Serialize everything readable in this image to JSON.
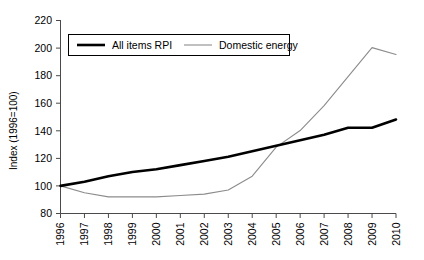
{
  "chart_data": {
    "type": "line",
    "title": "",
    "xlabel": "",
    "ylabel": "Index (1996=100)",
    "x": [
      1996,
      1997,
      1998,
      1999,
      2000,
      2001,
      2002,
      2003,
      2004,
      2005,
      2006,
      2007,
      2008,
      2009,
      2010
    ],
    "categories": [
      "1996",
      "1997",
      "1998",
      "1999",
      "2000",
      "2001",
      "2002",
      "2003",
      "2004",
      "2005",
      "2006",
      "2007",
      "2008",
      "2009",
      "2010"
    ],
    "ylim": [
      80,
      220
    ],
    "yticks": [
      80,
      100,
      120,
      140,
      160,
      180,
      200,
      220
    ],
    "ytick_labels": [
      "80",
      "100",
      "120",
      "140",
      "160",
      "180",
      "200",
      "220"
    ],
    "xtick_labels": [
      "1996",
      "1997",
      "1998",
      "1999",
      "2000",
      "2001",
      "2002",
      "2003",
      "2004",
      "2005",
      "2006",
      "2007",
      "2008",
      "2009",
      "2010"
    ],
    "grid": false,
    "legend_position": "top-left-inside",
    "series": [
      {
        "name": "All items RPI",
        "color": "#000000",
        "style": "thick-solid",
        "values": [
          100,
          103,
          107,
          110,
          112,
          115,
          118,
          121,
          125,
          129,
          133,
          137,
          142,
          142,
          148
        ]
      },
      {
        "name": "Domestic energy",
        "color": "#8c8c8c",
        "style": "thin-solid",
        "values": [
          100,
          95,
          92,
          92,
          92,
          93,
          94,
          97,
          107,
          128,
          140,
          158,
          179,
          200,
          195
        ]
      }
    ],
    "annotations": []
  },
  "legend": {
    "items": [
      {
        "label": "All items RPI"
      },
      {
        "label": "Domestic energy"
      }
    ]
  },
  "axes": {
    "y_axis_title": "Index (1996=100)"
  }
}
